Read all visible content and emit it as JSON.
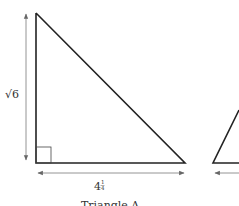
{
  "diagram": {
    "triangle_a": {
      "height_label": "√6",
      "base_label_whole": "4",
      "base_label_sup": "1",
      "base_label_sub": "4",
      "caption": "Triangle A"
    },
    "colors": {
      "line": "#222222",
      "arrow": "#777777",
      "text": "#333333"
    }
  }
}
